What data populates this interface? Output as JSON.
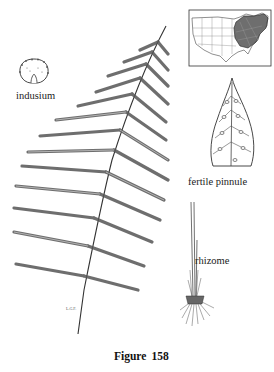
{
  "figure": {
    "caption_word": "Figure",
    "caption_number": "158",
    "labels": {
      "indusium": "indusium",
      "fertile_pinnule": "fertile pinnule",
      "rhizome": "rhizome"
    },
    "artist_initials": "L.G.F.",
    "colors": {
      "ink": "#333333",
      "map_range_fill": "#6e6e6e",
      "background": "#ffffff"
    }
  }
}
